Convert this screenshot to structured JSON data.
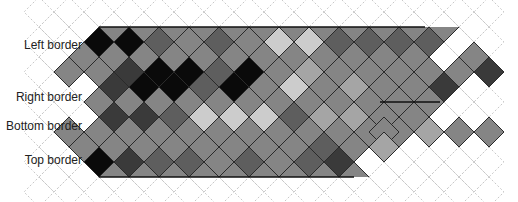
{
  "labels": {
    "left": "Left border",
    "right": "Right border",
    "bottom": "Bottom border",
    "top": "Top border"
  },
  "grid": {
    "half": 15,
    "clip_top": 27,
    "clip_bottom": 177,
    "dashed_color": "#c8c8c8",
    "edge_color": "#2a2a2a",
    "outline_color": "#111111"
  },
  "shades": {
    "k": "#0a0a0a",
    "d": "#3a3a3a",
    "m": "#5e5e5e",
    "g": "#858585",
    "l": "#a5a5a5",
    "w": "#cccccc"
  },
  "rows": [
    {
      "y": 27,
      "x0": 114,
      "cells": "gggggggggggg"
    },
    {
      "y": 42,
      "x0": 99,
      "cells": "kkmgmgwwmmmm"
    },
    {
      "y": 57,
      "x0": 84,
      "cells": "gggggggggggg",
      "extra": [
        {
          "x": 474,
          "s": "g"
        }
      ]
    },
    {
      "y": 72,
      "x0": 69,
      "cells": "ggdkkmkglgggggd"
    },
    {
      "y": 87,
      "x0": 114,
      "cells": "dkkmkgwglggd"
    },
    {
      "y": 102,
      "x0": 99,
      "cells": "gggggggggggg"
    },
    {
      "y": 117,
      "x0": 114,
      "cells": "ddmwwwmllgg"
    },
    {
      "y": 132,
      "x0": 69,
      "cells": "gggggggggggglgg",
      "extra": [
        {
          "x": 384,
          "s": "g"
        }
      ]
    },
    {
      "y": 147,
      "x0": 84,
      "cells": "ggggggggmgl"
    },
    {
      "y": 162,
      "x0": 99,
      "cells": "kdmmgmgmd"
    },
    {
      "y": 177,
      "x0": 114,
      "cells": "ggggggggg"
    }
  ]
}
